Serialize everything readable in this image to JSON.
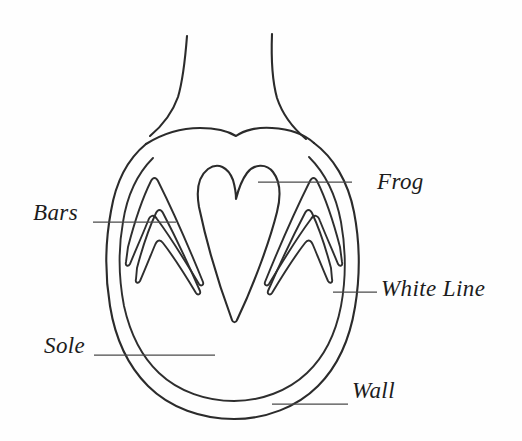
{
  "diagram": {
    "background_color": "#fefefe",
    "line_color": "#2b2b2b",
    "leader_color": "#4a4a4a",
    "labels": [
      {
        "id": "frog",
        "text": "Frog",
        "name": "label-frog",
        "leader_from": [
          352,
          182
        ],
        "leader_to": [
          258,
          182
        ]
      },
      {
        "id": "bars",
        "text": "Bars",
        "name": "label-bars",
        "leader_from": [
          93,
          222
        ],
        "leader_to": [
          176,
          222
        ]
      },
      {
        "id": "white_line",
        "text": "White Line",
        "name": "label-white-line",
        "leader_from": [
          377,
          292
        ],
        "leader_to": [
          333,
          292
        ]
      },
      {
        "id": "sole",
        "text": "Sole",
        "name": "label-sole",
        "leader_from": [
          94,
          355
        ],
        "leader_to": [
          215,
          355
        ]
      },
      {
        "id": "wall",
        "text": "Wall",
        "name": "label-wall",
        "leader_from": [
          348,
          404
        ],
        "leader_to": [
          272,
          404
        ]
      }
    ],
    "parts": [
      {
        "id": "pastern-left",
        "name": "pastern-left-outline"
      },
      {
        "id": "pastern-right",
        "name": "pastern-right-outline"
      },
      {
        "id": "heel-bulbs",
        "name": "heel-bulb-outline"
      },
      {
        "id": "hoof-wall-outer",
        "name": "hoof-wall-outer-outline"
      },
      {
        "id": "white-line-inner",
        "name": "white-line-inner-outline"
      },
      {
        "id": "frog-shape",
        "name": "frog-outline"
      },
      {
        "id": "bar-left",
        "name": "bar-left-outline"
      },
      {
        "id": "bar-right",
        "name": "bar-right-outline"
      }
    ]
  }
}
